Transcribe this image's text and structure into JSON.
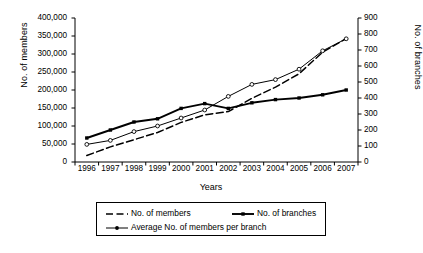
{
  "chart_data": {
    "type": "line",
    "title": "",
    "xlabel": "Years",
    "ylabel": "No. of members",
    "y2label": "No. of branches",
    "categories": [
      "1996",
      "1997",
      "1998",
      "1999",
      "2000",
      "2001",
      "2002",
      "2003",
      "2004",
      "2005",
      "2006",
      "2007"
    ],
    "ylim": [
      0,
      400000
    ],
    "y2lim": [
      0,
      900
    ],
    "yticks": [
      "0",
      "50,000",
      "100,000",
      "150,000",
      "200,000",
      "250,000",
      "300,000",
      "350,000",
      "400,000"
    ],
    "ytick_values": [
      0,
      50000,
      100000,
      150000,
      200000,
      250000,
      300000,
      350000,
      400000
    ],
    "y2ticks": [
      "0",
      "100",
      "200",
      "300",
      "400",
      "500",
      "600",
      "700",
      "800",
      "900"
    ],
    "y2tick_values": [
      0,
      100,
      200,
      300,
      400,
      500,
      600,
      700,
      800,
      900
    ],
    "grid": false,
    "legend_position": "bottom",
    "series": [
      {
        "name": "No. of members",
        "axis": "left",
        "line_style": "dashed",
        "marker": "none",
        "color": "#000000",
        "values": [
          18000,
          42000,
          62000,
          82000,
          110000,
          131000,
          140000,
          177000,
          208000,
          245000,
          305000,
          343000
        ]
      },
      {
        "name": "No. of branches",
        "axis": "right",
        "line_style": "solid-thick",
        "marker": "filled",
        "color": "#000000",
        "values": [
          150,
          200,
          250,
          270,
          335,
          365,
          335,
          370,
          390,
          400,
          420,
          450
        ]
      },
      {
        "name": "Average No. of members per branch",
        "axis": "right",
        "line_style": "solid-thin",
        "marker": "open-circle",
        "color": "#000000",
        "values": [
          110,
          135,
          190,
          225,
          275,
          325,
          410,
          485,
          515,
          580,
          695,
          770
        ]
      }
    ]
  },
  "legend": {
    "entries": [
      {
        "label": "No. of members"
      },
      {
        "label": "No. of branches"
      },
      {
        "label": "Average No. of members per branch"
      }
    ]
  },
  "colors": {
    "axis": "#000000",
    "background": "#ffffff",
    "series": "#000000"
  }
}
